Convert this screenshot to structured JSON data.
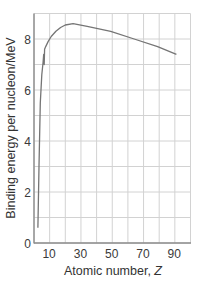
{
  "chart_data": {
    "type": "line",
    "title": "",
    "xlabel": "Atomic number, Z",
    "xlabel_main": "Atomic number, ",
    "xlabel_var": "Z",
    "ylabel": "Binding energy per nucleon/MeV",
    "xlim": [
      1,
      101
    ],
    "ylim": [
      0,
      9
    ],
    "grid": true,
    "x_ticks": [
      10,
      30,
      50,
      70,
      90
    ],
    "x_tick_labels": [
      "10",
      "30",
      "50",
      "70",
      "90"
    ],
    "y_ticks": [
      0,
      2,
      4,
      6,
      8
    ],
    "y_tick_labels": [
      "0",
      "2",
      "4",
      "6",
      "8"
    ],
    "x_gridlines": [
      1,
      11,
      21,
      31,
      41,
      51,
      61,
      71,
      81,
      91,
      101
    ],
    "y_gridlines": [
      0,
      1,
      2,
      3,
      4,
      5,
      6,
      7,
      8,
      9
    ],
    "series": [
      {
        "name": "Binding energy per nucleon",
        "x": [
          3.5,
          4.2,
          5,
          6,
          6.8,
          7.2,
          7.5,
          7.8,
          8.5,
          10,
          12,
          15,
          18,
          21,
          26,
          35,
          50,
          65,
          80,
          92
        ],
        "y": [
          0.6,
          3.0,
          5.5,
          6.6,
          7.1,
          7.4,
          7.0,
          7.6,
          7.7,
          7.9,
          8.1,
          8.3,
          8.45,
          8.55,
          8.6,
          8.5,
          8.3,
          8.0,
          7.7,
          7.4
        ]
      }
    ],
    "legend": null
  },
  "colors": {
    "curve": "#757575",
    "grid": "#d2d2d2",
    "axis": "#8c8c8c",
    "text": "#333333"
  }
}
